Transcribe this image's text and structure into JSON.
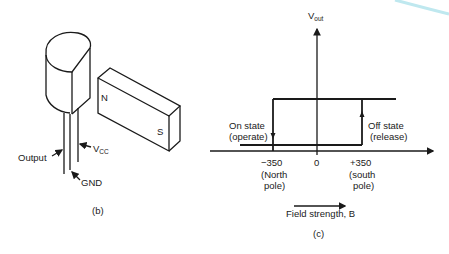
{
  "figure_b": {
    "caption": "(b)",
    "magnet": {
      "north_label": "N",
      "south_label": "S"
    },
    "leads": {
      "output_label": "Output",
      "vcc_label": "V",
      "vcc_sub": "CC",
      "gnd_label": "GND"
    }
  },
  "figure_c": {
    "caption": "(c)",
    "y_axis_label": "V",
    "y_axis_sub": "out",
    "ticks": [
      "−350",
      "0",
      "+350"
    ],
    "tick_notes": [
      [
        "(North",
        "pole)"
      ],
      [
        "(south",
        "pole)"
      ]
    ],
    "on_state": [
      "On state",
      "(operate)"
    ],
    "off_state": [
      "Off state",
      "(release)"
    ],
    "x_caption": "Field strength, B"
  },
  "colors": {
    "ink": "#1a1a1a",
    "accent_curve": "#bfe8ef"
  }
}
